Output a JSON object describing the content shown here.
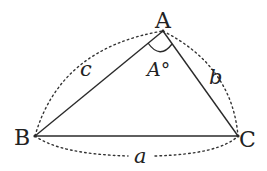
{
  "diagram": {
    "type": "triangle",
    "vertices": [
      {
        "id": "A",
        "label": "A",
        "x": 163,
        "y": 31
      },
      {
        "id": "B",
        "label": "B",
        "x": 35,
        "y": 136
      },
      {
        "id": "C",
        "label": "C",
        "x": 238,
        "y": 136
      }
    ],
    "sides": [
      {
        "id": "a",
        "label": "a",
        "from": "B",
        "to": "C"
      },
      {
        "id": "b",
        "label": "b",
        "from": "A",
        "to": "C"
      },
      {
        "id": "c",
        "label": "c",
        "from": "A",
        "to": "B"
      }
    ],
    "angle": {
      "vertex": "A",
      "label": "A°"
    },
    "colors": {
      "line": "#2a2a2a",
      "background": "#ffffff"
    }
  }
}
